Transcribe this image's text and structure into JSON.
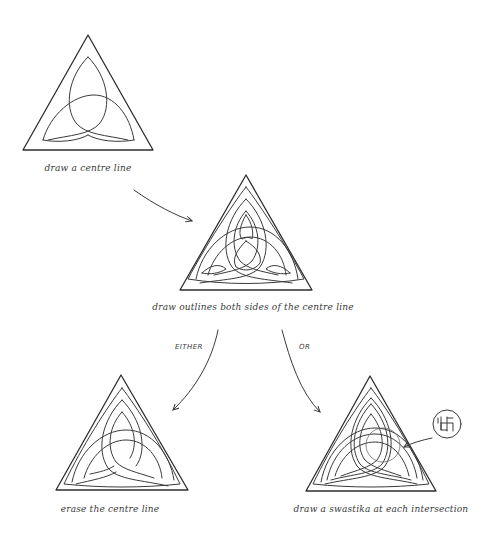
{
  "diagram": {
    "steps": [
      {
        "id": "step1",
        "caption": "draw a centre line"
      },
      {
        "id": "step2",
        "caption": "draw outlines both sides of the centre line"
      },
      {
        "id": "step3a",
        "caption": "erase the centre line"
      },
      {
        "id": "step3b",
        "caption": "draw a swastika at each intersection"
      }
    ],
    "branch_labels": {
      "left": "EITHER",
      "right": "OR"
    },
    "inset": {
      "icon": "swastika-icon",
      "description": "magnified intersection detail"
    },
    "colors": {
      "ink": "#3a3a3a",
      "background": "#ffffff"
    }
  }
}
